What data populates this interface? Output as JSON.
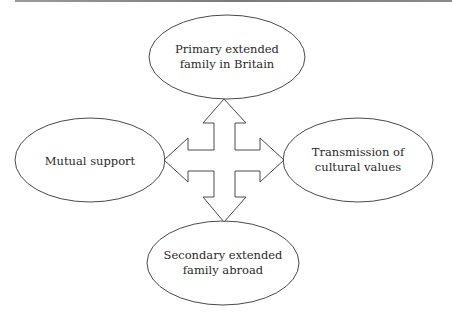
{
  "diagram": {
    "nodes": [
      {
        "id": "top",
        "lines": [
          "Primary extended",
          "family in Britain"
        ],
        "cx": 227,
        "cy": 57,
        "rx": 78,
        "ry": 42
      },
      {
        "id": "left",
        "lines": [
          "Mutual support"
        ],
        "cx": 90,
        "cy": 160,
        "rx": 75,
        "ry": 42
      },
      {
        "id": "right",
        "lines": [
          "Transmission of",
          "cultural values"
        ],
        "cx": 358,
        "cy": 160,
        "rx": 75,
        "ry": 42
      },
      {
        "id": "bottom",
        "lines": [
          "Secondary extended",
          "family abroad"
        ],
        "cx": 223,
        "cy": 263,
        "rx": 76,
        "ry": 42
      }
    ],
    "connector": "four-way-arrow",
    "stroke_color": "#4a4a4a"
  }
}
